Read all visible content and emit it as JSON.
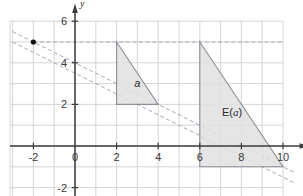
{
  "figure": {
    "axis_x_name": "x",
    "axis_y_name": "y",
    "colors": {
      "grid": "#c9c9cf",
      "axis": "#3b3b3b",
      "dashed_line": "#a9a9b4",
      "shape_fill": "#e0e0e0",
      "shape_stroke": "#8d8d96",
      "point": "#111111",
      "text": "#333333"
    },
    "labels": {
      "small_triangle": "a",
      "big_region": "E(a)",
      "big_region_prefix": "E(",
      "big_region_var": "a",
      "big_region_suffix": ")"
    }
  },
  "chart_data": {
    "type": "scatter",
    "title": "",
    "xlabel": "x",
    "ylabel": "y",
    "xlim": [
      -3,
      10.6
    ],
    "ylim": [
      -2.6,
      6.4
    ],
    "grid": true,
    "grid_step": 1,
    "legend": "none",
    "xticks": [
      -2,
      0,
      2,
      4,
      6,
      8,
      10
    ],
    "xtick_labels": [
      "-2",
      "0",
      "2",
      "4",
      "6",
      "8",
      "10"
    ],
    "yticks": [
      -2,
      2,
      4,
      6
    ],
    "ytick_labels": [
      "-2",
      "2",
      "4",
      "6"
    ],
    "points": [
      {
        "x": -2,
        "y": 5,
        "label": "",
        "style": "filled-dot"
      }
    ],
    "dashed_lines": [
      {
        "name": "upper",
        "slope": -0.5,
        "intercept": 4,
        "x_from": -3,
        "x_to": 10.6,
        "points_through": [
          [
            -2,
            5
          ],
          [
            0,
            4
          ],
          [
            8,
            0
          ]
        ]
      },
      {
        "name": "lower",
        "slope": -0.5,
        "intercept": 3.5,
        "x_from": -3,
        "x_to": 10.6,
        "points_through": [
          [
            -3,
            5
          ],
          [
            0,
            3.5
          ],
          [
            9,
            -1
          ]
        ]
      }
    ],
    "dashed_guides": [
      {
        "name": "horizontal-y5",
        "type": "horizontal",
        "y": 5,
        "x_from": -2,
        "x_to": 10
      }
    ],
    "shapes": [
      {
        "name": "small-triangle",
        "label": "a",
        "vertices": [
          [
            2,
            5
          ],
          [
            2,
            2
          ],
          [
            4,
            2
          ]
        ],
        "fill": "#e0e0e0",
        "stroke": "#8d8d96"
      },
      {
        "name": "big-triangle",
        "label": "E(a)",
        "vertices": [
          [
            6,
            5
          ],
          [
            6,
            -1
          ],
          [
            10,
            -1
          ]
        ],
        "fill": "#e0e0e0",
        "stroke": "#8d8d96"
      }
    ],
    "annotations": [
      {
        "text": "a",
        "x": 3.0,
        "y": 2.85,
        "italic": true
      },
      {
        "text": "E(a)",
        "x": 7.55,
        "y": 1.45,
        "italic_part": "a"
      }
    ]
  }
}
